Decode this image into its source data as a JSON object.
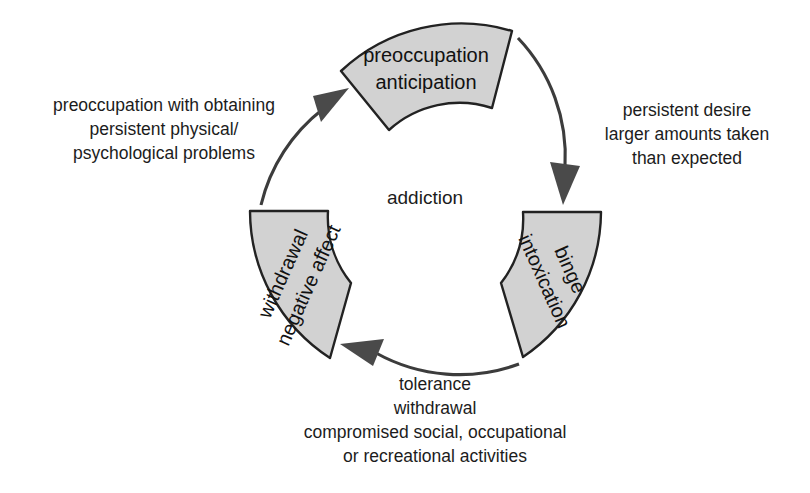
{
  "diagram": {
    "center_label": "addiction",
    "background_color": "#ffffff",
    "segment_fill_color": "#d2d2d2",
    "segment_stroke_color": "#222222",
    "arrow_color": "#4a4a4a",
    "segments": [
      {
        "id": "preoccupation",
        "position": "top",
        "lines": [
          "preoccupation",
          "anticipation"
        ],
        "line1": "preoccupation",
        "line2": "anticipation"
      },
      {
        "id": "binge",
        "position": "right",
        "lines": [
          "binge",
          "intoxication"
        ],
        "line1": "binge",
        "line2": "intoxication"
      },
      {
        "id": "withdrawal",
        "position": "left",
        "lines": [
          "withdrawal",
          "negative affect"
        ],
        "line1": "withdrawal",
        "line2": "negative affect"
      }
    ],
    "annotations": {
      "left": "preoccupation with obtaining\npersistent physical/\npsychological problems",
      "right": "persistent desire\nlarger amounts taken\nthan expected",
      "bottom": "tolerance\nwithdrawal\ncompromised social, occupational\nor recreational activities"
    },
    "arrows": [
      {
        "id": "arrow-preoccupation-to-binge",
        "from": "preoccupation",
        "to": "binge",
        "direction": "clockwise"
      },
      {
        "id": "arrow-binge-to-withdrawal",
        "from": "binge",
        "to": "withdrawal",
        "direction": "clockwise"
      },
      {
        "id": "arrow-withdrawal-to-preoccupation",
        "from": "withdrawal",
        "to": "preoccupation",
        "direction": "clockwise"
      }
    ]
  }
}
